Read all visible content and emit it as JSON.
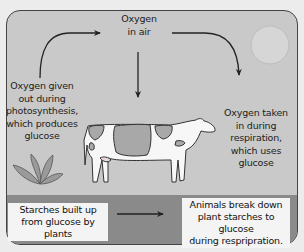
{
  "diagram": {
    "labels": {
      "oxygen_in_air": [
        "Oxygen",
        "in air"
      ],
      "photosynthesis": [
        "Oxygen given",
        "out during",
        "photosynthesis,",
        "which produces",
        "glucose"
      ],
      "respiration": [
        "Oxygen taken",
        "in during",
        "respiration,",
        "which uses",
        "glucose"
      ]
    },
    "boxes": {
      "starches": [
        "Starches built up",
        "from glucose by plants"
      ],
      "animals": [
        "Animals break down",
        "plant starches to glucose",
        "during respripration."
      ]
    },
    "icons": [
      "sun-icon",
      "plant-icon",
      "cow-icon",
      "arrow-icon"
    ],
    "colors": {
      "background": "#ececec",
      "sky": "#c9c9c9",
      "ground": "#8a8a8a",
      "sun": "#d6d6d6",
      "cow_patch": "#a8a8a8",
      "plant": "#9a9a9a",
      "box": "#f4f4f4"
    }
  }
}
